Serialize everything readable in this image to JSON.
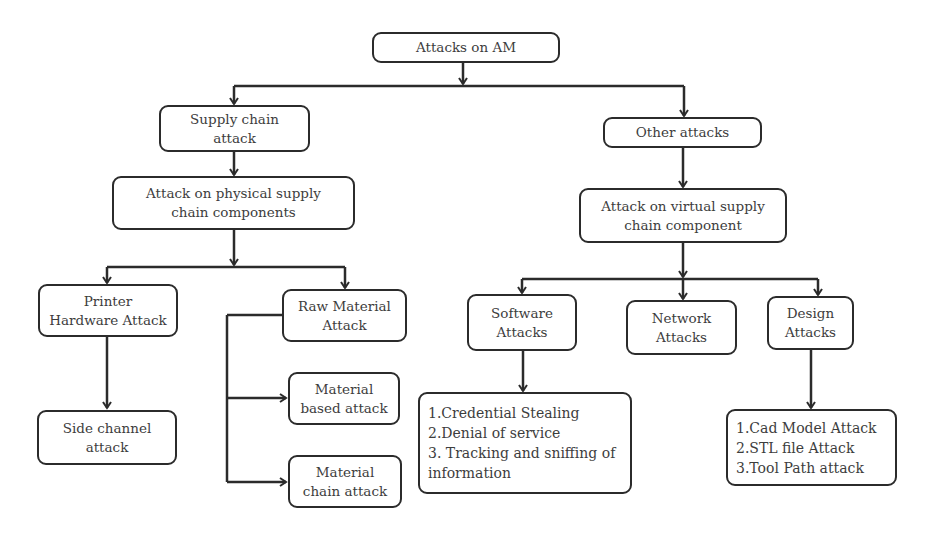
{
  "diagram": {
    "title": "Attacks on AM",
    "nodes": {
      "root": {
        "lines": [
          "Attacks on AM"
        ]
      },
      "supply_chain": {
        "lines": [
          "Supply chain",
          "attack"
        ]
      },
      "other": {
        "lines": [
          "Other attacks"
        ]
      },
      "physical": {
        "lines": [
          "Attack on physical supply",
          "chain components"
        ]
      },
      "virtual": {
        "lines": [
          "Attack on virtual supply",
          "chain component"
        ]
      },
      "printer": {
        "lines": [
          "Printer",
          "Hardware Attack"
        ]
      },
      "raw_material": {
        "lines": [
          "Raw Material",
          "Attack"
        ]
      },
      "side_channel": {
        "lines": [
          "Side channel",
          "attack"
        ]
      },
      "material_based": {
        "lines": [
          "Material",
          "based attack"
        ]
      },
      "material_chain": {
        "lines": [
          "Material",
          "chain attack"
        ]
      },
      "software": {
        "lines": [
          "Software",
          "Attacks"
        ]
      },
      "network": {
        "lines": [
          "Network",
          "Attacks"
        ]
      },
      "design": {
        "lines": [
          "Design",
          "Attacks"
        ]
      },
      "software_list": {
        "lines": [
          "1.Credential Stealing",
          "2.Denial of service",
          "3. Tracking and sniffing of",
          "information"
        ]
      },
      "design_list": {
        "lines": [
          "1.Cad Model Attack",
          "2.STL file Attack",
          "3.Tool Path attack"
        ]
      }
    },
    "edges": [
      [
        "root",
        "supply_chain"
      ],
      [
        "root",
        "other"
      ],
      [
        "supply_chain",
        "physical"
      ],
      [
        "other",
        "virtual"
      ],
      [
        "physical",
        "printer"
      ],
      [
        "physical",
        "raw_material"
      ],
      [
        "printer",
        "side_channel"
      ],
      [
        "raw_material",
        "material_based"
      ],
      [
        "raw_material",
        "material_chain"
      ],
      [
        "virtual",
        "software"
      ],
      [
        "virtual",
        "network"
      ],
      [
        "virtual",
        "design"
      ],
      [
        "software",
        "software_list"
      ],
      [
        "design",
        "design_list"
      ]
    ],
    "colors": {
      "stroke": "#2b2b2b",
      "text": "#3d3d3d",
      "background": "#ffffff"
    }
  }
}
